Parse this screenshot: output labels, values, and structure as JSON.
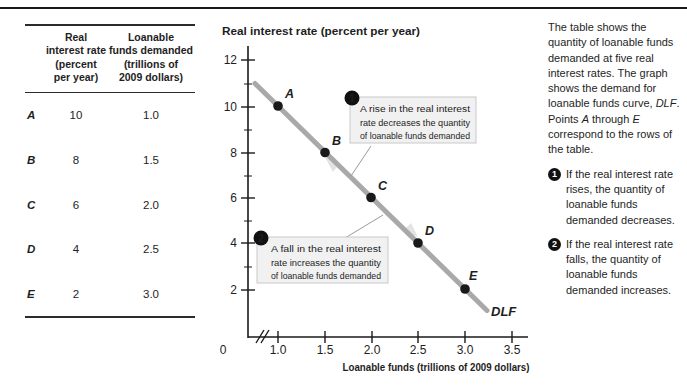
{
  "table": {
    "col1_header_lines": [
      "Real",
      "interest rate",
      "(percent",
      "per year)"
    ],
    "col2_header_lines": [
      "Loanable",
      "funds demanded",
      "(trillions of",
      "2009 dollars)"
    ],
    "rows": [
      {
        "label": "A",
        "rate": "10",
        "funds": "1.0"
      },
      {
        "label": "B",
        "rate": "8",
        "funds": "1.5"
      },
      {
        "label": "C",
        "rate": "6",
        "funds": "2.0"
      },
      {
        "label": "D",
        "rate": "4",
        "funds": "2.5"
      },
      {
        "label": "E",
        "rate": "2",
        "funds": "3.0"
      }
    ]
  },
  "graph": {
    "y_axis_title": "Real interest rate (percent per year)",
    "x_axis_title": "Loanable funds (trillions of 2009 dollars)",
    "y_tick_labels": [
      "12",
      "10",
      "8",
      "6",
      "4",
      "2"
    ],
    "x_tick_labels": [
      "1.0",
      "1.5",
      "2.0",
      "2.5",
      "3.0",
      "3.5"
    ],
    "origin_label": "0",
    "curve_label": "DLF",
    "points": [
      {
        "name": "A",
        "x": 1.0,
        "y": 10
      },
      {
        "name": "B",
        "x": 1.5,
        "y": 8
      },
      {
        "name": "C",
        "x": 2.0,
        "y": 6
      },
      {
        "name": "D",
        "x": 2.5,
        "y": 4
      },
      {
        "name": "E",
        "x": 3.0,
        "y": 2
      }
    ],
    "callout_rise": {
      "num": "1",
      "lines": [
        "A rise in the real interest",
        "rate decreases the quantity",
        "of loanable funds demanded"
      ]
    },
    "callout_fall": {
      "num": "2",
      "lines": [
        "A fall in the real interest",
        "rate increases the quantity",
        "of loanable funds demanded"
      ]
    }
  },
  "sidebar": {
    "paragraph_segments": [
      {
        "t": "The table shows the quantity of loanable funds demanded at five real interest rates. The graph shows the demand for loanable funds curve, "
      },
      {
        "t": "DLF",
        "i": true
      },
      {
        "t": ". Points "
      },
      {
        "t": "A",
        "i": true
      },
      {
        "t": " through "
      },
      {
        "t": "E",
        "i": true
      },
      {
        "t": " correspond to the rows of the table."
      }
    ],
    "notes": [
      {
        "num": "1",
        "text": "If the real interest rate rises, the quantity of loanable funds demanded decreases."
      },
      {
        "num": "2",
        "text": "If the real interest rate falls, the quantity of loanable funds demanded increases."
      }
    ]
  },
  "chart_data": {
    "type": "line",
    "title": "",
    "xlabel": "Loanable funds (trillions of 2009 dollars)",
    "ylabel": "Real interest rate (percent per year)",
    "xlim": [
      0,
      3.5
    ],
    "ylim": [
      0,
      12
    ],
    "x_ticks": [
      1.0,
      1.5,
      2.0,
      2.5,
      3.0,
      3.5
    ],
    "y_ticks": [
      2,
      4,
      6,
      8,
      10,
      12
    ],
    "grid": false,
    "legend": "none",
    "series": [
      {
        "name": "DLF",
        "x": [
          1.0,
          1.5,
          2.0,
          2.5,
          3.0
        ],
        "y": [
          10,
          8,
          6,
          4,
          2
        ],
        "point_labels": [
          "A",
          "B",
          "C",
          "D",
          "E"
        ]
      }
    ],
    "annotations": [
      "A rise in the real interest rate decreases the quantity of loanable funds demanded",
      "A fall in the real interest rate increases the quantity of loanable funds demanded"
    ]
  },
  "colors": {
    "curve": "#a9a9a9",
    "point": "#1a1a1a",
    "callout_bg": "#f1f1f1",
    "callout_border": "#c9c9c9",
    "badge": "#111111",
    "text": "#1e1e1e"
  }
}
